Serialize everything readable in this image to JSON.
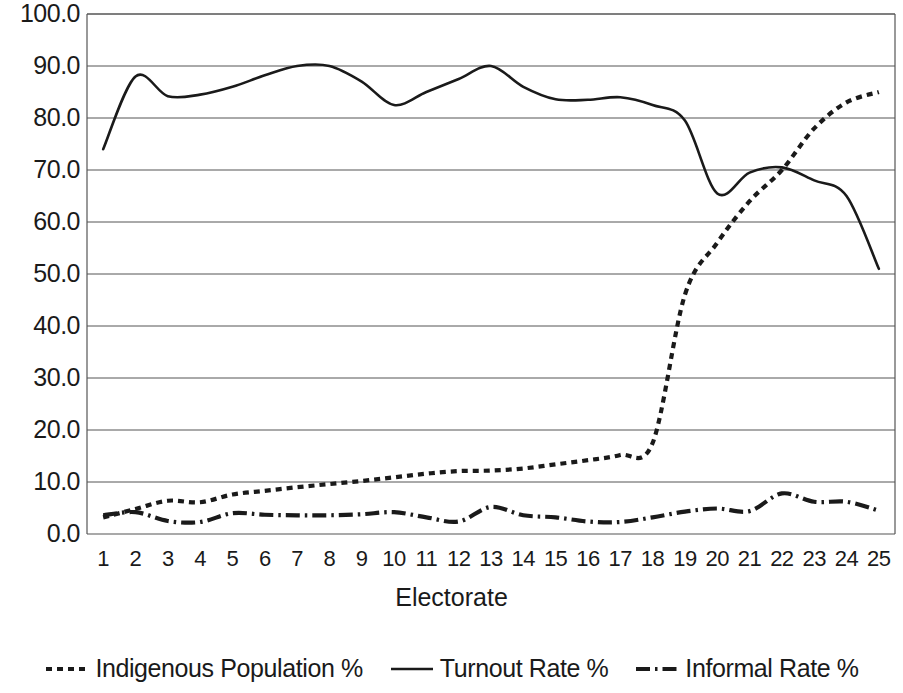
{
  "chart_data": {
    "type": "line",
    "title": "",
    "xlabel": "Electorate",
    "ylabel": "",
    "xlim": [
      0.5,
      25.5
    ],
    "ylim": [
      0,
      100
    ],
    "grid": true,
    "legend_position": "bottom",
    "x": [
      1,
      2,
      3,
      4,
      5,
      6,
      7,
      8,
      9,
      10,
      11,
      12,
      13,
      14,
      15,
      16,
      17,
      18,
      19,
      20,
      21,
      22,
      23,
      24,
      25
    ],
    "categories": [
      "1",
      "2",
      "3",
      "4",
      "5",
      "6",
      "7",
      "8",
      "9",
      "10",
      "11",
      "12",
      "13",
      "14",
      "15",
      "16",
      "17",
      "18",
      "19",
      "20",
      "21",
      "22",
      "23",
      "24",
      "25"
    ],
    "x_tick_labels": [
      "1",
      "2",
      "3",
      "4",
      "5",
      "6",
      "7",
      "8",
      "9",
      "10",
      "11",
      "12",
      "13",
      "14",
      "15",
      "16",
      "17",
      "18",
      "19",
      "20",
      "21",
      "22",
      "23",
      "24",
      "25"
    ],
    "y_tick_labels": [
      "100.0",
      "90.0",
      "80.0",
      "70.0",
      "60.0",
      "50.0",
      "40.0",
      "30.0",
      "20.0",
      "10.0",
      "0.0"
    ],
    "y_ticks": [
      100,
      90,
      80,
      70,
      60,
      50,
      40,
      30,
      20,
      10,
      0
    ],
    "series": [
      {
        "name": "Indigenous Population %",
        "style": "dotted",
        "color": "#1a1a1a",
        "values": [
          3.2,
          4.8,
          6.4,
          6.1,
          7.6,
          8.3,
          9.0,
          9.6,
          10.2,
          10.9,
          11.6,
          12.1,
          12.2,
          12.6,
          13.4,
          14.2,
          15.2,
          17.5,
          46.0,
          56.0,
          64.0,
          70.0,
          78.0,
          83.0,
          85.0
        ]
      },
      {
        "name": "Turnout Rate %",
        "style": "solid",
        "color": "#1a1a1a",
        "values": [
          74.0,
          88.0,
          84.2,
          84.5,
          86.0,
          88.2,
          90.0,
          90.0,
          87.0,
          82.5,
          85.0,
          87.5,
          90.0,
          86.0,
          83.6,
          83.5,
          84.0,
          82.5,
          79.5,
          65.5,
          69.5,
          70.5,
          68.0,
          65.0,
          51.0
        ]
      },
      {
        "name": "Informal Rate %",
        "style": "dashdot",
        "color": "#1a1a1a",
        "values": [
          3.6,
          4.2,
          2.5,
          2.3,
          4.0,
          3.7,
          3.6,
          3.6,
          3.8,
          4.2,
          3.2,
          2.4,
          5.2,
          3.6,
          3.2,
          2.4,
          2.3,
          3.2,
          4.3,
          4.9,
          4.4,
          7.8,
          6.2,
          6.2,
          4.5
        ]
      }
    ]
  },
  "axis": {
    "x_title": "Electorate"
  },
  "legend": {
    "items": [
      {
        "label": "Indigenous Population %",
        "icon": "dotted-line-icon"
      },
      {
        "label": "Turnout Rate %",
        "icon": "solid-line-icon"
      },
      {
        "label": "Informal Rate %",
        "icon": "dash-dot-line-icon"
      }
    ]
  },
  "plot_geometry": {
    "left": 87,
    "right": 895,
    "top": 14,
    "bottom": 534
  }
}
